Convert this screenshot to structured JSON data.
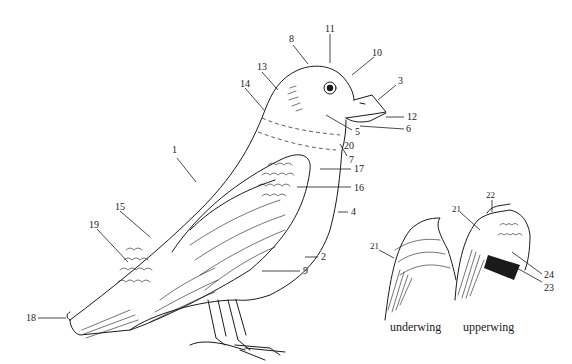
{
  "diagram": {
    "type": "anatomy-labeled-illustration",
    "labels": [
      {
        "id": "1",
        "text": "1",
        "x": 172,
        "y": 150
      },
      {
        "id": "2",
        "text": "2",
        "x": 321,
        "y": 253
      },
      {
        "id": "3",
        "text": "3",
        "x": 398,
        "y": 77
      },
      {
        "id": "4",
        "text": "4",
        "x": 351,
        "y": 207
      },
      {
        "id": "5",
        "text": "5",
        "x": 355,
        "y": 127
      },
      {
        "id": "6",
        "text": "6",
        "x": 406,
        "y": 125
      },
      {
        "id": "7",
        "text": "7",
        "x": 349,
        "y": 154
      },
      {
        "id": "8",
        "text": "8",
        "x": 289,
        "y": 35
      },
      {
        "id": "9",
        "text": "9",
        "x": 303,
        "y": 268
      },
      {
        "id": "10",
        "text": "10",
        "x": 372,
        "y": 49
      },
      {
        "id": "11",
        "text": "11",
        "x": 325,
        "y": 24
      },
      {
        "id": "12",
        "text": "12",
        "x": 407,
        "y": 113
      },
      {
        "id": "13",
        "text": "13",
        "x": 257,
        "y": 63
      },
      {
        "id": "14",
        "text": "14",
        "x": 240,
        "y": 80
      },
      {
        "id": "15",
        "text": "15",
        "x": 115,
        "y": 203
      },
      {
        "id": "16",
        "text": "16",
        "x": 354,
        "y": 183
      },
      {
        "id": "17",
        "text": "17",
        "x": 354,
        "y": 165
      },
      {
        "id": "18",
        "text": "18",
        "x": 26,
        "y": 314
      },
      {
        "id": "19",
        "text": "19",
        "x": 89,
        "y": 222
      },
      {
        "id": "20",
        "text": "20",
        "x": 344,
        "y": 140
      },
      {
        "id": "21a",
        "text": "21",
        "x": 371,
        "y": 245
      },
      {
        "id": "21b",
        "text": "21",
        "x": 452,
        "y": 208
      },
      {
        "id": "22",
        "text": "22",
        "x": 487,
        "y": 191
      },
      {
        "id": "23",
        "text": "23",
        "x": 544,
        "y": 283
      },
      {
        "id": "24",
        "text": "24",
        "x": 544,
        "y": 270
      }
    ],
    "captions": {
      "underwing": "underwing",
      "upperwing": "upperwing"
    },
    "colors": {
      "ink": "#1a1a1a",
      "background": "#ffffff"
    }
  }
}
